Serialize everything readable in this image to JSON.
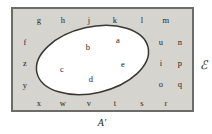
{
  "diagram": {
    "type": "venn-euler-set-diagram",
    "colors": {
      "page_background": "#ffffff",
      "universe_fill": "#d6d4cf",
      "universe_border": "#6e6c68",
      "ellipse_fill": "#ffffff",
      "ellipse_border": "#3a3833",
      "text": "#262522"
    },
    "universe": {
      "label": "ℰ",
      "label_name": "script-capital-e",
      "label_x": 203,
      "label_y": 65
    },
    "set_region": {
      "name": "set-a-ellipse",
      "cx": 92.5,
      "cy": 60,
      "rx": 57,
      "ry": 33,
      "rotation_deg": -13
    },
    "complement": {
      "label": "A′",
      "label_name": "set-a-complement",
      "label_x": 102,
      "label_y": 122
    },
    "inside_elements": [
      {
        "id": "a",
        "label": "a",
        "x": 118,
        "y": 40
      },
      {
        "id": "b",
        "label": "b",
        "x": 88,
        "y": 47
      },
      {
        "id": "c",
        "label": "c",
        "x": 62,
        "y": 69
      },
      {
        "id": "d",
        "label": "d",
        "x": 91,
        "y": 79
      },
      {
        "id": "e",
        "label": "e",
        "x": 123,
        "y": 64
      }
    ],
    "outside_elements": [
      {
        "id": "g",
        "label": "g",
        "x": 39,
        "y": 20
      },
      {
        "id": "h",
        "label": "h",
        "x": 63,
        "y": 20
      },
      {
        "id": "j",
        "label": "j",
        "x": 89,
        "y": 20
      },
      {
        "id": "k",
        "label": "k",
        "x": 115,
        "y": 20
      },
      {
        "id": "l",
        "label": "l",
        "x": 142,
        "y": 20
      },
      {
        "id": "m",
        "label": "m",
        "x": 166,
        "y": 20
      },
      {
        "id": "f",
        "label": "f",
        "x": 25,
        "y": 42
      },
      {
        "id": "z",
        "label": "z",
        "x": 25,
        "y": 63
      },
      {
        "id": "y",
        "label": "y",
        "x": 25,
        "y": 85
      },
      {
        "id": "u",
        "label": "u",
        "x": 161,
        "y": 42
      },
      {
        "id": "n",
        "label": "n",
        "x": 180,
        "y": 42
      },
      {
        "id": "i",
        "label": "i",
        "x": 161,
        "y": 63
      },
      {
        "id": "p",
        "label": "p",
        "x": 180,
        "y": 63
      },
      {
        "id": "o",
        "label": "o",
        "x": 161,
        "y": 84
      },
      {
        "id": "q",
        "label": "q",
        "x": 180,
        "y": 84
      },
      {
        "id": "x",
        "label": "x",
        "x": 39,
        "y": 103
      },
      {
        "id": "w",
        "label": "w",
        "x": 63,
        "y": 103
      },
      {
        "id": "v",
        "label": "v",
        "x": 89,
        "y": 103
      },
      {
        "id": "t",
        "label": "t",
        "x": 115,
        "y": 103
      },
      {
        "id": "s",
        "label": "s",
        "x": 142,
        "y": 103
      },
      {
        "id": "r",
        "label": "r",
        "x": 166,
        "y": 103
      }
    ]
  }
}
